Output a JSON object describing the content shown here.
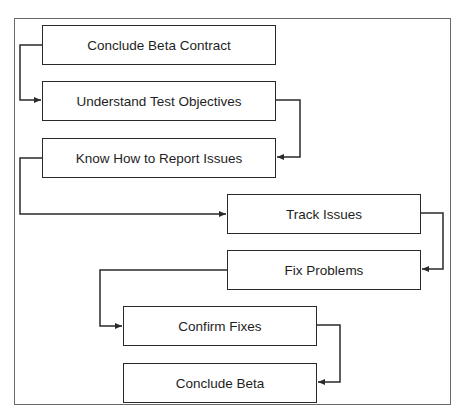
{
  "diagram": {
    "type": "flowchart",
    "steps": [
      {
        "id": "s1",
        "label": "Conclude Beta Contract"
      },
      {
        "id": "s2",
        "label": "Understand Test Objectives"
      },
      {
        "id": "s3",
        "label": "Know How to Report Issues"
      },
      {
        "id": "s4",
        "label": "Track Issues"
      },
      {
        "id": "s5",
        "label": "Fix Problems"
      },
      {
        "id": "s6",
        "label": "Confirm Fixes"
      },
      {
        "id": "s7",
        "label": "Conclude Beta"
      }
    ],
    "edges": [
      {
        "from": "s1",
        "to": "s2"
      },
      {
        "from": "s2",
        "to": "s3"
      },
      {
        "from": "s3",
        "to": "s4"
      },
      {
        "from": "s4",
        "to": "s5"
      },
      {
        "from": "s5",
        "to": "s6"
      },
      {
        "from": "s6",
        "to": "s7"
      }
    ],
    "colors": {
      "line": "#2a2a2a",
      "frame": "#6a6a6a",
      "background": "#ffffff"
    }
  }
}
